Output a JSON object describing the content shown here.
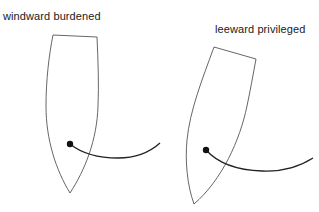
{
  "diagram": {
    "boats": [
      {
        "id": "windward",
        "label": "windward burdened"
      },
      {
        "id": "leeward",
        "label": "leeward privileged"
      }
    ],
    "colors": {
      "hull_stroke": "#555555",
      "line_stroke": "#222222",
      "dot_fill": "#111111",
      "background": "#ffffff"
    }
  }
}
